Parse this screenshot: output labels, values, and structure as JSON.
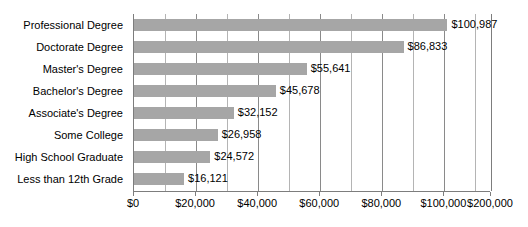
{
  "chart_data": {
    "type": "bar",
    "orientation": "horizontal",
    "title": "",
    "xlabel": "",
    "ylabel": "",
    "grid": true,
    "legend": null,
    "xlim": [
      0,
      115000
    ],
    "categories": [
      "Professional Degree",
      "Doctorate Degree",
      "Master's Degree",
      "Bachelor's Degree",
      "Associate's Degree",
      "Some College",
      "High School Graduate",
      "Less than 12th Grade"
    ],
    "values": [
      100987,
      86833,
      55641,
      45678,
      32152,
      26958,
      24572,
      16121
    ],
    "value_labels": [
      "$100,987",
      "$86,833",
      "$55,641",
      "$45,678",
      "$32,152",
      "$26,958",
      "$24,572",
      "$16,121"
    ],
    "xticks": [
      0,
      20000,
      40000,
      60000,
      80000,
      100000,
      115000
    ],
    "xtick_labels": [
      "$0",
      "$20,000",
      "$40,000",
      "$60,000",
      "$80,000",
      "$100,000",
      "$200,000"
    ],
    "minor_gridlines": [
      10000,
      30000,
      50000,
      70000,
      90000,
      110000
    ],
    "bar_color": "#a6a6a6",
    "gridline_color": "#b4b4b4",
    "axis_color": "#7d7d7d",
    "text_color": "#000000",
    "background_color": "#ffffff"
  }
}
